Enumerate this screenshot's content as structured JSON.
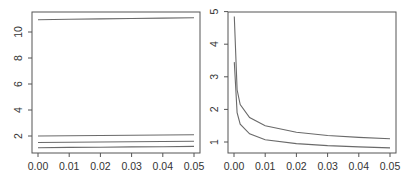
{
  "chart_data": [
    {
      "type": "line",
      "title": "",
      "xlabel": "",
      "ylabel": "",
      "xlim": [
        0.0,
        0.05
      ],
      "ylim": [
        1.0,
        11.2
      ],
      "grid": false,
      "legend": null,
      "x_ticks": [
        "0.00",
        "0.01",
        "0.02",
        "0.03",
        "0.04",
        "0.05"
      ],
      "y_ticks": [
        "2",
        "4",
        "6",
        "8",
        "10"
      ],
      "x": [
        0.0,
        0.01,
        0.02,
        0.03,
        0.04,
        0.05
      ],
      "series": [
        {
          "name": "line-1",
          "values": [
            10.95,
            10.98,
            11.01,
            11.04,
            11.07,
            11.1
          ]
        },
        {
          "name": "line-2",
          "values": [
            2.0,
            2.02,
            2.04,
            2.06,
            2.08,
            2.1
          ]
        },
        {
          "name": "line-3",
          "values": [
            1.5,
            1.52,
            1.54,
            1.56,
            1.58,
            1.6
          ]
        },
        {
          "name": "line-4",
          "values": [
            1.1,
            1.12,
            1.14,
            1.16,
            1.18,
            1.2
          ]
        }
      ]
    },
    {
      "type": "line",
      "title": "",
      "xlabel": "",
      "ylabel": "",
      "xlim": [
        0.0,
        0.05
      ],
      "ylim": [
        0.8,
        5.0
      ],
      "grid": false,
      "legend": null,
      "x_ticks": [
        "0.00",
        "0.01",
        "0.02",
        "0.03",
        "0.04",
        "0.05"
      ],
      "y_ticks": [
        "1",
        "2",
        "3",
        "4",
        "5"
      ],
      "x": [
        0.0001,
        0.001,
        0.002,
        0.005,
        0.01,
        0.02,
        0.03,
        0.04,
        0.05
      ],
      "series": [
        {
          "name": "upper-curve",
          "values": [
            4.85,
            2.6,
            2.15,
            1.75,
            1.5,
            1.3,
            1.2,
            1.14,
            1.1
          ]
        },
        {
          "name": "lower-curve",
          "values": [
            3.45,
            1.9,
            1.55,
            1.25,
            1.07,
            0.95,
            0.89,
            0.85,
            0.82
          ]
        }
      ]
    }
  ]
}
